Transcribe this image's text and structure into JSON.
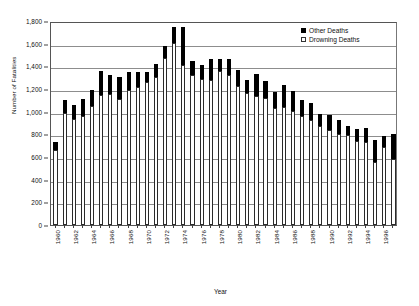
{
  "chart_data": {
    "type": "bar",
    "stacked": true,
    "title": "",
    "xlabel": "Year",
    "ylabel": "Number of Fatalities",
    "ylim": [
      0,
      1800
    ],
    "ytick_step": 200,
    "ytick_labels": [
      "0",
      "200",
      "400",
      "600",
      "800",
      "1,000",
      "1,200",
      "1,400",
      "1,600",
      "1,800"
    ],
    "grid": true,
    "legend_position": "top-right",
    "xtick_step": 2,
    "xtick_labels": [
      "1960",
      "1962",
      "1964",
      "1966",
      "1968",
      "1970",
      "1972",
      "1974",
      "1976",
      "1978",
      "1980",
      "1982",
      "1984",
      "1986",
      "1988",
      "1990",
      "1992",
      "1994",
      "1996"
    ],
    "categories": [
      "1960",
      "1961",
      "1962",
      "1963",
      "1964",
      "1965",
      "1966",
      "1967",
      "1968",
      "1969",
      "1970",
      "1971",
      "1972",
      "1973",
      "1974",
      "1975",
      "1976",
      "1977",
      "1978",
      "1979",
      "1980",
      "1981",
      "1982",
      "1983",
      "1984",
      "1985",
      "1986",
      "1987",
      "1988",
      "1989",
      "1990",
      "1991",
      "1992",
      "1993",
      "1994",
      "1995",
      "1996",
      "1997"
    ],
    "series": [
      {
        "name": "Drowning Deaths",
        "color": "#ffffff",
        "values": [
          660,
          985,
          935,
          960,
          1050,
          1150,
          1155,
          1115,
          1195,
          1215,
          1260,
          1310,
          1470,
          1605,
          1415,
          1325,
          1285,
          1280,
          1355,
          1320,
          1230,
          1165,
          1140,
          1125,
          1035,
          1045,
          1010,
          965,
          930,
          870,
          840,
          805,
          790,
          740,
          730,
          555,
          690,
          580
        ]
      },
      {
        "name": "Other Deaths",
        "color": "#000000",
        "values": [
          70,
          120,
          120,
          155,
          145,
          205,
          165,
          195,
          155,
          135,
          90,
          110,
          110,
          145,
          330,
          120,
          125,
          185,
          110,
          145,
          140,
          115,
          190,
          145,
          135,
          190,
          175,
          140,
          150,
          110,
          130,
          120,
          85,
          110,
          125,
          195,
          95,
          220
        ]
      }
    ],
    "totals": [
      730,
      1105,
      1055,
      1115,
      1195,
      1355,
      1320,
      1310,
      1350,
      1350,
      1350,
      1420,
      1580,
      1750,
      1745,
      1445,
      1410,
      1465,
      1465,
      1465,
      1370,
      1280,
      1330,
      1270,
      1170,
      1235,
      1185,
      1105,
      1080,
      980,
      970,
      925,
      875,
      850,
      855,
      750,
      785,
      800
    ]
  },
  "legend": {
    "items": [
      {
        "label": "Other Deaths",
        "swatch": "filled"
      },
      {
        "label": "Drowning Deaths",
        "swatch": "hollow"
      }
    ]
  },
  "axes": {
    "y_title": "Number of Fatalities",
    "x_title": "Year"
  }
}
